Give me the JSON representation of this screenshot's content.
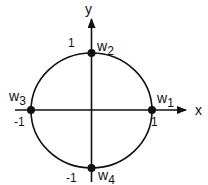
{
  "diagram": {
    "type": "unit-circle-roots",
    "axes": {
      "x_label": "x",
      "y_label": "y"
    },
    "ticks": {
      "x_pos": "1",
      "x_neg": "-1",
      "y_pos": "1",
      "y_neg": "-1"
    },
    "points": [
      {
        "name": "w",
        "sub": "1",
        "position": "(1, 0)"
      },
      {
        "name": "w",
        "sub": "2",
        "position": "(0, 1)"
      },
      {
        "name": "w",
        "sub": "3",
        "position": "(-1, 0)"
      },
      {
        "name": "w",
        "sub": "4",
        "position": "(0, -1)"
      }
    ],
    "colors": {
      "stroke": "#111111",
      "background": "#ffffff"
    }
  }
}
